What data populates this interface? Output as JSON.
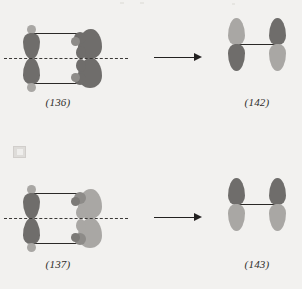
{
  "page": {
    "background": "#f2f1ef",
    "width": 302,
    "height": 289
  },
  "colors": {
    "lobe_dark": "#6f6d6b",
    "lobe_light": "#a9a7a4",
    "line": "#2b2927",
    "axis": "#3a3836",
    "label_text": "#2e2c2a"
  },
  "diagram": {
    "type": "orbital-correlation-diagram",
    "rows": [
      {
        "id": "row-top",
        "reactant": {
          "label": "(136)",
          "name": "twisted-diene-orbital-array",
          "mirror_axis": "horizontal-dashed",
          "left_orbitals": [
            {
              "position": "upper-left",
              "top_phase": "light",
              "bottom_phase": "dark"
            },
            {
              "position": "lower-left",
              "top_phase": "dark",
              "bottom_phase": "light"
            }
          ],
          "right_orbitals": [
            {
              "position": "upper-right",
              "twisted": true,
              "phase": "dark"
            },
            {
              "position": "lower-right",
              "twisted": true,
              "phase": "dark"
            }
          ]
        },
        "arrow": {
          "name": "transformation-arrow",
          "direction": "right"
        },
        "product": {
          "label": "(142)",
          "name": "two-p-orbital-product",
          "symmetry": "antisymmetric",
          "orbitals": [
            {
              "position": "left",
              "top_phase": "light",
              "bottom_phase": "dark"
            },
            {
              "position": "right",
              "top_phase": "dark",
              "bottom_phase": "light"
            }
          ]
        }
      },
      {
        "id": "row-bottom",
        "reactant": {
          "label": "(137)",
          "name": "twisted-diene-orbital-array",
          "mirror_axis": "horizontal-dashed",
          "left_orbitals": [
            {
              "position": "upper-left",
              "top_phase": "light",
              "bottom_phase": "dark"
            },
            {
              "position": "lower-left",
              "top_phase": "dark",
              "bottom_phase": "light"
            }
          ],
          "right_orbitals": [
            {
              "position": "upper-right",
              "twisted": true,
              "phase": "light"
            },
            {
              "position": "lower-right",
              "twisted": true,
              "phase": "light"
            }
          ]
        },
        "arrow": {
          "name": "transformation-arrow",
          "direction": "right"
        },
        "product": {
          "label": "(143)",
          "name": "two-p-orbital-product",
          "symmetry": "symmetric",
          "orbitals": [
            {
              "position": "left",
              "top_phase": "dark",
              "bottom_phase": "light"
            },
            {
              "position": "right",
              "top_phase": "dark",
              "bottom_phase": "light"
            }
          ]
        }
      }
    ]
  }
}
